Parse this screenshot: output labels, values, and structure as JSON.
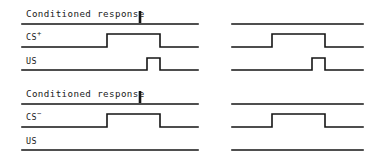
{
  "figure": {
    "width": 374,
    "height": 161,
    "background": "#ffffff",
    "ink_color": "#141414"
  },
  "blocks": [
    {
      "id": "block-cs-plus",
      "name": "cs-plus-block",
      "panels": [
        {
          "id": "panel-cs-plus-left",
          "name": "cs-plus-left-panel",
          "labelled": true,
          "x": 4,
          "trace_left": 22,
          "trace_right": 198,
          "channels": [
            {
              "id": "cr",
              "label": "Conditioned response",
              "label_type": "text",
              "label_x": 26,
              "label_y": 9,
              "baseline_y": 24,
              "waveform": "flat",
              "marker": {
                "type": "response-tick",
                "x": 140,
                "top_y": 11,
                "bottom_y": 23
              }
            },
            {
              "id": "cs",
              "label": "CS",
              "label_sup": "+",
              "label_type": "channel",
              "label_x": 26,
              "label_y": 33,
              "baseline_y": 47,
              "waveform": "pulse",
              "pulse_rise_x": 107,
              "pulse_fall_x": 160,
              "pulse_height": 13
            },
            {
              "id": "us",
              "label": "US",
              "label_type": "channel",
              "label_x": 26,
              "label_y": 57,
              "baseline_y": 70,
              "waveform": "pulse",
              "pulse_rise_x": 147,
              "pulse_fall_x": 160,
              "pulse_height": 12
            }
          ]
        },
        {
          "id": "panel-cs-plus-right",
          "name": "cs-plus-right-panel",
          "labelled": false,
          "x": 232,
          "trace_left": 232,
          "trace_right": 363,
          "channels": [
            {
              "id": "cr",
              "baseline_y": 24,
              "waveform": "flat",
              "marker": null
            },
            {
              "id": "cs",
              "baseline_y": 47,
              "waveform": "pulse",
              "pulse_rise_x": 272,
              "pulse_fall_x": 325,
              "pulse_height": 13
            },
            {
              "id": "us",
              "baseline_y": 70,
              "waveform": "pulse",
              "pulse_rise_x": 312,
              "pulse_fall_x": 325,
              "pulse_height": 12
            }
          ]
        }
      ]
    },
    {
      "id": "block-cs-minus",
      "name": "cs-minus-block",
      "panels": [
        {
          "id": "panel-cs-minus-left",
          "name": "cs-minus-left-panel",
          "labelled": true,
          "x": 4,
          "trace_left": 22,
          "trace_right": 198,
          "channels": [
            {
              "id": "cr",
              "label": "Conditioned response",
              "label_type": "text",
              "label_x": 26,
              "label_y": 89,
              "baseline_y": 104,
              "waveform": "flat",
              "marker": {
                "type": "response-tick",
                "x": 140,
                "top_y": 91,
                "bottom_y": 103
              }
            },
            {
              "id": "cs",
              "label": "CS",
              "label_sup": "−",
              "label_type": "channel",
              "label_x": 26,
              "label_y": 113,
              "baseline_y": 127,
              "waveform": "pulse",
              "pulse_rise_x": 107,
              "pulse_fall_x": 160,
              "pulse_height": 13
            },
            {
              "id": "us",
              "label": "US",
              "label_type": "channel",
              "label_x": 26,
              "label_y": 137,
              "baseline_y": 150,
              "waveform": "flat",
              "marker": null
            }
          ]
        },
        {
          "id": "panel-cs-minus-right",
          "name": "cs-minus-right-panel",
          "labelled": false,
          "x": 232,
          "trace_left": 232,
          "trace_right": 363,
          "channels": [
            {
              "id": "cr",
              "baseline_y": 104,
              "waveform": "flat",
              "marker": null
            },
            {
              "id": "cs",
              "baseline_y": 127,
              "waveform": "pulse",
              "pulse_rise_x": 272,
              "pulse_fall_x": 325,
              "pulse_height": 13
            },
            {
              "id": "us",
              "baseline_y": 150,
              "waveform": "flat",
              "marker": null
            }
          ]
        }
      ]
    }
  ]
}
